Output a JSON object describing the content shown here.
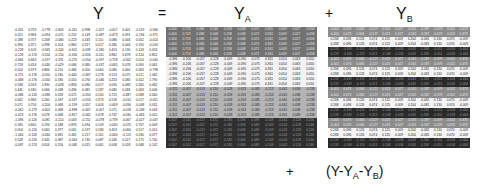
{
  "labels": {
    "y": "Y",
    "equals": "=",
    "ya_base": "Y",
    "ya_sub": "A",
    "plus1": "+",
    "yb_base": "Y",
    "yb_sub": "B",
    "plus2": "+",
    "residual_open": "(Y-Y",
    "residual_sub_a": "A",
    "residual_mid": "-Y",
    "residual_sub_b": "B",
    "residual_close": ")"
  },
  "matrix_shape": {
    "rows": 24,
    "cols": 11
  },
  "band_colors": {
    "ya": [
      "#727272",
      "#f2f2f2",
      "#b4b4b4",
      "#2f2f2f"
    ],
    "yb": [
      "#8c8c8c",
      "#f4f4f4",
      "#2a2a2a"
    ]
  },
  "y_rows": [
    [
      "-0.261",
      "0.759",
      "-0.778",
      "-0.803",
      "-0.261",
      "0.998",
      "-1.057",
      "-0.057",
      "0.401",
      "-0.519",
      "-0.566"
    ],
    [
      "0.021",
      "0.984",
      "-0.094",
      "-0.071",
      "0.252",
      "0.149",
      "-0.087",
      "-0.473",
      "0.091",
      "-0.194",
      "-0.971"
    ],
    [
      "0.188",
      "0.707",
      "0.268",
      "-0.080",
      "0.223",
      "0.043",
      "0.110",
      "0.086",
      "0.044",
      "0.052",
      "-0.014"
    ],
    [
      "0.396",
      "0.371",
      "0.398",
      "0.204",
      "0.860",
      "0.317",
      "0.017",
      "0.280",
      "0.044",
      "0.190",
      "-0.016"
    ],
    [
      "-0.228",
      "0.109",
      "-0.945",
      "-0.240",
      "-0.652",
      "-0.039",
      "-0.280",
      "0.453",
      "0.130",
      "0.143",
      "0.053"
    ],
    [
      "-0.128",
      "-0.174",
      "-0.550",
      "-0.150",
      "-0.160",
      "-0.616",
      "-0.011",
      "0.862",
      "0.678",
      "0.124",
      "0.852"
    ],
    [
      "-0.666",
      "0.663",
      "-0.197",
      "-0.291",
      "-0.270",
      "-0.054",
      "-0.097",
      "-0.728",
      "-0.562",
      "0.014",
      "-0.040"
    ],
    [
      "0.718",
      "0.454",
      "-0.430",
      "-0.029",
      "0.066",
      "0.080",
      "-0.037",
      "-0.065",
      "0.078",
      "0.090",
      "0.065"
    ],
    [
      "0.024",
      "0.979",
      "0.866",
      "0.210",
      "0.466",
      "0.050",
      "0.060",
      "0.080",
      "0.060",
      "0.063",
      "-0.798"
    ],
    [
      "-0.275",
      "-0.176",
      "-0.050",
      "0.180",
      "0.440",
      "-0.467",
      "0.278",
      "0.513",
      "0.075",
      "0.211",
      "1.062"
    ],
    [
      "-0.468",
      "-0.176",
      "-0.050",
      "0.180",
      "0.050",
      "0.190",
      "-0.046",
      "0.253",
      "0.080",
      "0.052",
      "1.790"
    ],
    [
      "0.548",
      "0.163",
      "0.390",
      "-0.028",
      "0.856",
      "0.080",
      "0.017",
      "0.090",
      "0.083",
      "0.260",
      "0.462"
    ],
    [
      "0.445",
      "0.180",
      "0.066",
      "0.038",
      "0.496",
      "0.081",
      "0.187",
      "0.080",
      "0.083",
      "0.063",
      "0.006"
    ],
    [
      "-0.086",
      "-0.126",
      "-0.486",
      "0.058",
      "0.072",
      "-0.050",
      "0.100",
      "0.725",
      "-0.487",
      "0.068",
      "0.060"
    ],
    [
      "0.062",
      "0.966",
      "0.260",
      "0.187",
      "-0.537",
      "-0.053",
      "0.373",
      "0.518",
      "-0.010",
      "0.017",
      "-0.051"
    ],
    [
      "0.071",
      "0.756",
      "-0.204",
      "0.068",
      "-0.199",
      "-0.057",
      "0.003",
      "-0.469",
      "-0.090",
      "-0.048",
      "0.031"
    ],
    [
      "-0.062",
      "-0.179",
      "-0.602",
      "0.068",
      "-0.898",
      "-0.067",
      "-0.007",
      "1.071",
      "-0.018",
      "-0.248",
      "0.043"
    ],
    [
      "-0.023",
      "-0.176",
      "0.078",
      "0.068",
      "-0.817",
      "-0.062",
      "0.078",
      "0.732",
      "-0.030",
      "-0.463",
      "0.010"
    ],
    [
      "-1.096",
      "-0.126",
      "-0.081",
      "-0.214",
      "0.063",
      "-0.151",
      "-0.078",
      "-0.739",
      "-0.067",
      "-0.027",
      "-0.047"
    ],
    [
      "0.180",
      "0.660",
      "0.194",
      "0.188",
      "0.876",
      "0.094",
      "0.109",
      "-0.030",
      "-0.070",
      "0.707",
      "0.003"
    ],
    [
      "0.054",
      "-0.126",
      "0.060",
      "0.377",
      "0.061",
      "0.197",
      "0.184",
      "0.453",
      "-0.060",
      "0.517",
      "0.010"
    ],
    [
      "-1.064",
      "-0.126",
      "-0.060",
      "0.081",
      "0.461",
      "0.217",
      "0.110",
      "-0.440",
      "-0.113",
      "0.030",
      "0.077"
    ],
    [
      "0.528",
      "-0.126",
      "0.345",
      "0.387",
      "-0.064",
      "0.745",
      "0.087",
      "0.146",
      "0.017",
      "0.175",
      "1.740"
    ],
    [
      "-0.087",
      "-0.174",
      "0.016",
      "0.156",
      "-0.046",
      "0.015",
      "0.061",
      "0.008",
      "0.018",
      "0.048",
      "0.142"
    ]
  ],
  "ya_rows": [
    [
      "0.400",
      "0.713",
      "0.086",
      "0.046",
      "0.258",
      "0.048",
      "0.071",
      "0.361",
      "0.049",
      "0.027",
      "-0.058"
    ],
    [
      "0.400",
      "0.713",
      "0.086",
      "0.046",
      "0.258",
      "0.048",
      "0.071",
      "0.361",
      "0.049",
      "0.027",
      "-0.058"
    ],
    [
      "0.400",
      "0.713",
      "0.086",
      "0.046",
      "0.258",
      "0.048",
      "0.071",
      "0.361",
      "0.049",
      "0.027",
      "-0.058"
    ],
    [
      "0.400",
      "0.713",
      "0.086",
      "0.046",
      "0.258",
      "0.048",
      "0.071",
      "0.361",
      "0.049",
      "0.027",
      "-0.058"
    ],
    [
      "0.400",
      "0.713",
      "0.086",
      "0.046",
      "0.258",
      "0.048",
      "0.071",
      "0.361",
      "0.049",
      "0.027",
      "-0.058"
    ],
    [
      "0.400",
      "0.713",
      "0.086",
      "0.046",
      "0.258",
      "0.048",
      "0.071",
      "0.361",
      "0.049",
      "0.027",
      "-0.058"
    ],
    [
      "-0.396",
      "-0.206",
      "-0.057",
      "-0.228",
      "-0.049",
      "-0.090",
      "-0.075",
      "0.361",
      "0.054",
      "0.063",
      "0.050"
    ],
    [
      "-0.396",
      "-0.206",
      "-0.057",
      "-0.228",
      "-0.049",
      "-0.090",
      "-0.075",
      "0.361",
      "0.054",
      "0.063",
      "0.050"
    ],
    [
      "-0.396",
      "-0.206",
      "-0.057",
      "-0.228",
      "-0.049",
      "-0.090",
      "-0.075",
      "0.361",
      "0.054",
      "0.063",
      "0.050"
    ],
    [
      "-0.396",
      "-0.206",
      "-0.057",
      "-0.228",
      "-0.049",
      "-0.090",
      "-0.075",
      "0.361",
      "0.054",
      "0.063",
      "0.050"
    ],
    [
      "-0.396",
      "-0.206",
      "-0.057",
      "-0.228",
      "-0.049",
      "-0.090",
      "-0.075",
      "0.361",
      "0.054",
      "0.063",
      "0.050"
    ],
    [
      "-0.396",
      "-0.206",
      "-0.057",
      "-0.228",
      "-0.049",
      "-0.090",
      "-0.075",
      "0.361",
      "0.054",
      "0.063",
      "0.050"
    ],
    [
      "-0.311",
      "-0.007",
      "-0.013",
      "0.210",
      "-0.028",
      "-0.053",
      "-0.085",
      "-0.213",
      "-0.061",
      "0.038",
      "-0.238"
    ],
    [
      "-0.311",
      "-0.007",
      "-0.013",
      "0.210",
      "-0.028",
      "-0.053",
      "-0.085",
      "-0.213",
      "-0.061",
      "0.038",
      "-0.238"
    ],
    [
      "-0.311",
      "-0.007",
      "-0.013",
      "0.210",
      "-0.028",
      "-0.053",
      "-0.085",
      "-0.213",
      "-0.061",
      "0.038",
      "-0.238"
    ],
    [
      "-0.311",
      "-0.007",
      "-0.013",
      "0.210",
      "-0.028",
      "-0.053",
      "-0.085",
      "-0.213",
      "-0.061",
      "0.038",
      "-0.238"
    ],
    [
      "-0.311",
      "-0.007",
      "-0.013",
      "0.210",
      "-0.028",
      "-0.053",
      "-0.085",
      "-0.213",
      "-0.061",
      "0.038",
      "-0.238"
    ],
    [
      "-0.311",
      "-0.007",
      "-0.013",
      "0.210",
      "-0.028",
      "-0.053",
      "-0.085",
      "-0.213",
      "-0.061",
      "0.038",
      "-0.238"
    ],
    [
      "0.307",
      "-0.501",
      "-0.017",
      "0.072",
      "-0.181",
      "0.096",
      "0.089",
      "-0.509",
      "-0.042",
      "-0.128",
      "0.246"
    ],
    [
      "0.307",
      "-0.501",
      "-0.017",
      "0.072",
      "-0.181",
      "0.096",
      "0.089",
      "-0.509",
      "-0.042",
      "-0.128",
      "0.246"
    ],
    [
      "0.307",
      "-0.501",
      "-0.017",
      "0.072",
      "-0.181",
      "0.096",
      "0.089",
      "-0.509",
      "-0.042",
      "-0.128",
      "0.246"
    ],
    [
      "0.307",
      "-0.501",
      "-0.017",
      "0.072",
      "-0.181",
      "0.096",
      "0.089",
      "-0.509",
      "-0.042",
      "-0.128",
      "0.246"
    ],
    [
      "0.307",
      "-0.501",
      "-0.017",
      "0.072",
      "-0.181",
      "0.096",
      "0.089",
      "-0.509",
      "-0.042",
      "-0.128",
      "0.246"
    ],
    [
      "0.307",
      "-0.501",
      "-0.017",
      "0.072",
      "-0.181",
      "0.096",
      "0.089",
      "-0.509",
      "-0.042",
      "-0.128",
      "0.246"
    ]
  ],
  "yb_rows": [
    [
      "-0.401",
      "0.073",
      "0.066",
      "-0.127",
      "0.023",
      "0.027",
      "-0.161",
      "-0.187",
      "-0.079",
      "-0.052",
      "0.473"
    ],
    [
      "-0.401",
      "0.073",
      "0.066",
      "-0.127",
      "0.023",
      "0.027",
      "-0.161",
      "-0.187",
      "-0.079",
      "-0.052",
      "0.473"
    ],
    [
      "0.268",
      "0.096",
      "0.126",
      "0.074",
      "0.125",
      "0.009",
      "0.204",
      "-0.081",
      "0.130",
      "0.070",
      "-0.009"
    ],
    [
      "0.268",
      "0.096",
      "0.126",
      "0.074",
      "0.125",
      "0.009",
      "0.204",
      "-0.081",
      "0.130",
      "0.070",
      "-0.009"
    ],
    [
      "0.133",
      "-0.169",
      "-0.192",
      "0.053",
      "-0.148",
      "-0.036",
      "0.043",
      "0.268",
      "-0.051",
      "-0.018",
      "-0.464"
    ],
    [
      "0.133",
      "-0.169",
      "-0.192",
      "0.053",
      "-0.148",
      "-0.036",
      "0.043",
      "0.268",
      "-0.051",
      "-0.018",
      "-0.464"
    ],
    [
      "-0.401",
      "0.073",
      "0.066",
      "-0.127",
      "0.023",
      "0.027",
      "-0.161",
      "-0.187",
      "-0.079",
      "-0.052",
      "0.473"
    ],
    [
      "-0.401",
      "0.073",
      "0.066",
      "-0.127",
      "0.023",
      "0.027",
      "-0.161",
      "-0.187",
      "-0.079",
      "-0.052",
      "0.473"
    ],
    [
      "0.268",
      "0.096",
      "0.126",
      "0.074",
      "0.125",
      "0.009",
      "0.204",
      "-0.081",
      "0.130",
      "0.070",
      "-0.009"
    ],
    [
      "0.268",
      "0.096",
      "0.126",
      "0.074",
      "0.125",
      "0.009",
      "0.204",
      "-0.081",
      "0.130",
      "0.070",
      "-0.009"
    ],
    [
      "0.133",
      "-0.169",
      "-0.192",
      "0.053",
      "-0.148",
      "-0.036",
      "0.043",
      "0.268",
      "-0.051",
      "-0.018",
      "-0.464"
    ],
    [
      "0.133",
      "-0.169",
      "-0.192",
      "0.053",
      "-0.148",
      "-0.036",
      "0.043",
      "0.268",
      "-0.051",
      "-0.018",
      "-0.464"
    ],
    [
      "-0.401",
      "0.073",
      "0.066",
      "-0.127",
      "0.023",
      "0.027",
      "-0.161",
      "-0.187",
      "-0.079",
      "-0.052",
      "0.473"
    ],
    [
      "-0.401",
      "0.073",
      "0.066",
      "-0.127",
      "0.023",
      "0.027",
      "-0.161",
      "-0.187",
      "-0.079",
      "-0.052",
      "0.473"
    ],
    [
      "0.268",
      "0.096",
      "0.126",
      "0.074",
      "0.125",
      "0.009",
      "0.204",
      "-0.081",
      "0.130",
      "0.070",
      "-0.009"
    ],
    [
      "0.268",
      "0.096",
      "0.126",
      "0.074",
      "0.125",
      "0.009",
      "0.204",
      "-0.081",
      "0.130",
      "0.070",
      "-0.009"
    ],
    [
      "0.133",
      "-0.169",
      "-0.192",
      "0.053",
      "-0.148",
      "-0.036",
      "0.043",
      "0.268",
      "-0.051",
      "-0.018",
      "-0.464"
    ],
    [
      "0.133",
      "-0.169",
      "-0.192",
      "0.053",
      "-0.148",
      "-0.036",
      "0.043",
      "0.268",
      "-0.051",
      "-0.018",
      "-0.464"
    ],
    [
      "-0.401",
      "0.073",
      "0.066",
      "-0.127",
      "0.023",
      "0.027",
      "-0.161",
      "-0.187",
      "-0.079",
      "-0.052",
      "0.473"
    ],
    [
      "-0.401",
      "0.073",
      "0.066",
      "-0.127",
      "0.023",
      "0.027",
      "-0.161",
      "-0.187",
      "-0.079",
      "-0.052",
      "0.473"
    ],
    [
      "0.268",
      "0.096",
      "0.126",
      "0.074",
      "0.125",
      "0.009",
      "0.204",
      "-0.081",
      "0.130",
      "0.070",
      "-0.009"
    ],
    [
      "0.268",
      "0.096",
      "0.126",
      "0.074",
      "0.125",
      "0.009",
      "0.204",
      "-0.081",
      "0.130",
      "0.070",
      "-0.009"
    ],
    [
      "0.133",
      "-0.169",
      "-0.192",
      "0.053",
      "-0.148",
      "-0.036",
      "0.043",
      "0.268",
      "-0.051",
      "-0.018",
      "-0.464"
    ],
    [
      "0.133",
      "-0.169",
      "-0.192",
      "0.053",
      "-0.148",
      "-0.036",
      "0.043",
      "0.268",
      "-0.051",
      "-0.018",
      "-0.464"
    ]
  ]
}
